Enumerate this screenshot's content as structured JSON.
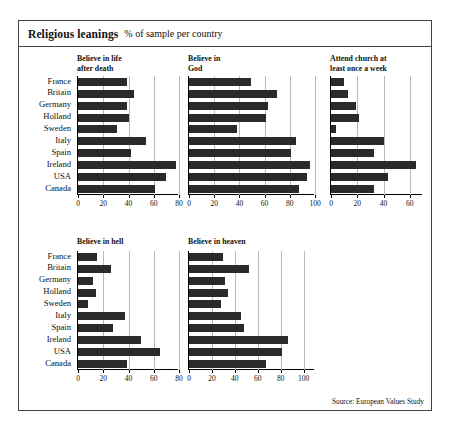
{
  "header": {
    "title": "Religious leanings",
    "subtitle": "% of sample per country"
  },
  "source_note": "Source: European Values Study",
  "countries": [
    "France",
    "Britain",
    "Germany",
    "Holland",
    "Sweden",
    "Italy",
    "Spain",
    "Ireland",
    "USA",
    "Canada"
  ],
  "chart_data": {
    "type": "bar",
    "title": "Religious leanings",
    "subtitle": "% of sample per country",
    "orientation": "horizontal",
    "grid": true,
    "legend": "none",
    "xlabel": "",
    "ylabel": "",
    "categories": [
      "France",
      "Britain",
      "Germany",
      "Holland",
      "Sweden",
      "Italy",
      "Spain",
      "Ireland",
      "USA",
      "Canada"
    ],
    "panels": [
      {
        "id": "life-after-death",
        "title": "Believe in life\nafter death",
        "xlim": [
          0,
          80
        ],
        "ticks": [
          0,
          20,
          40,
          60,
          80
        ],
        "values": [
          39,
          44,
          39,
          40,
          31,
          54,
          42,
          78,
          70,
          61
        ]
      },
      {
        "id": "believe-in-god",
        "title": "Believe in\nGod",
        "xlim": [
          0,
          100
        ],
        "ticks": [
          0,
          20,
          40,
          60,
          80,
          100
        ],
        "values": [
          49,
          70,
          63,
          61,
          38,
          85,
          81,
          96,
          94,
          87
        ]
      },
      {
        "id": "attend-church",
        "title": "Attend church at\nleast once a week",
        "xlim": [
          0,
          70
        ],
        "ticks": [
          0,
          20,
          40,
          60
        ],
        "values": [
          10,
          13,
          19,
          21,
          4,
          40,
          33,
          65,
          43,
          33
        ]
      },
      {
        "id": "believe-in-hell",
        "title": "Believe in hell",
        "xlim": [
          0,
          80
        ],
        "ticks": [
          0,
          20,
          40,
          60,
          80
        ],
        "values": [
          15,
          26,
          12,
          14,
          8,
          37,
          28,
          50,
          65,
          39
        ]
      },
      {
        "id": "believe-in-heaven",
        "title": "Believe in heaven",
        "xlim": [
          0,
          110
        ],
        "ticks": [
          0,
          20,
          40,
          60,
          80,
          100
        ],
        "values": [
          30,
          52,
          31,
          34,
          28,
          45,
          48,
          86,
          81,
          67
        ]
      }
    ]
  }
}
